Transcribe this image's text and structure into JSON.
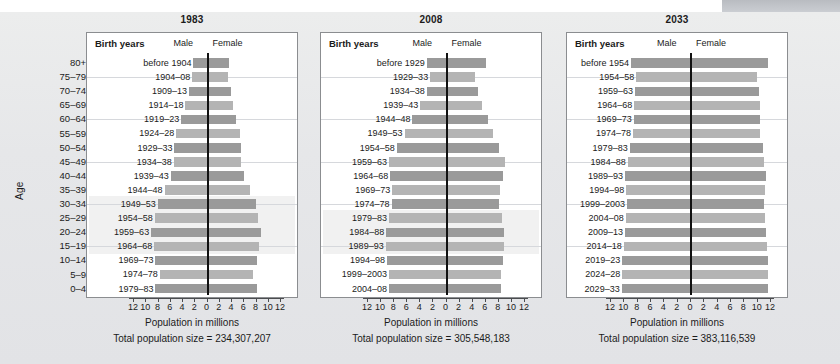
{
  "figure": {
    "corner_badge": "",
    "top_cut_text": ""
  },
  "axis": {
    "age_label": "Age",
    "age_groups": [
      "80+",
      "75–79",
      "70–74",
      "65–69",
      "60–64",
      "55–59",
      "50–54",
      "45–49",
      "40–44",
      "35–39",
      "30–34",
      "25–29",
      "20–24",
      "15–19",
      "10–14",
      "5–9",
      "0–4"
    ],
    "x_title": "Population in millions",
    "x_ticks": [
      12,
      10,
      8,
      6,
      4,
      2,
      0,
      2,
      4,
      6,
      8,
      10,
      12
    ],
    "x_max": 12,
    "headers": {
      "birth_years": "Birth years",
      "male": "Male",
      "female": "Female"
    }
  },
  "panels": [
    {
      "title": "1983",
      "total_label": "Total population size = 234,307,207",
      "birth_years": [
        "before 1904",
        "1904–08",
        "1909–13",
        "1914–18",
        "1919–23",
        "1924–28",
        "1929–33",
        "1934–38",
        "1939–43",
        "1944–48",
        "1949–53",
        "1954–58",
        "1959–63",
        "1964–68",
        "1969–73",
        "1974–78",
        "1979–83"
      ],
      "male": [
        2.3,
        2.5,
        3.0,
        3.6,
        4.3,
        5.1,
        5.4,
        5.5,
        6.0,
        7.0,
        8.1,
        8.6,
        9.2,
        8.7,
        8.5,
        7.8,
        8.5
      ],
      "female": [
        3.5,
        3.4,
        3.8,
        4.1,
        4.6,
        5.3,
        5.5,
        5.5,
        6.0,
        6.9,
        7.9,
        8.3,
        8.8,
        8.4,
        8.1,
        7.4,
        8.1
      ],
      "highlight_rows": [
        10,
        11,
        12,
        13
      ]
    },
    {
      "title": "2008",
      "total_label": "Total population size = 305,548,183",
      "birth_years": [
        "before 1929",
        "1929–33",
        "1934–38",
        "1939–43",
        "1944–48",
        "1949–53",
        "1954–58",
        "1959–63",
        "1964–68",
        "1969–73",
        "1974–78",
        "1979–83",
        "1984–88",
        "1989–93",
        "1994–98",
        "1999–2003",
        "2004–08"
      ],
      "male": [
        3.0,
        2.5,
        3.0,
        4.0,
        5.2,
        6.4,
        7.6,
        8.8,
        8.6,
        8.3,
        8.4,
        8.8,
        9.2,
        9.3,
        9.1,
        8.8,
        8.8
      ],
      "female": [
        6.0,
        4.4,
        4.8,
        5.4,
        6.3,
        7.1,
        8.0,
        8.9,
        8.6,
        8.2,
        8.1,
        8.5,
        8.8,
        8.8,
        8.6,
        8.4,
        8.4
      ],
      "highlight_rows": [
        11,
        12,
        13
      ]
    },
    {
      "title": "2033",
      "total_label": "Total population size = 383,116,539",
      "birth_years": [
        "before 1954",
        "1954–58",
        "1959–63",
        "1964–68",
        "1969–73",
        "1974–78",
        "1979–83",
        "1984–88",
        "1989–93",
        "1994–98",
        "1999–2003",
        "2004–08",
        "2009–13",
        "2014–18",
        "2019–23",
        "2024–28",
        "2029–33"
      ],
      "male": [
        9.0,
        8.2,
        8.4,
        8.5,
        8.6,
        8.7,
        9.2,
        9.5,
        9.9,
        9.7,
        9.6,
        9.8,
        9.9,
        10.1,
        10.3,
        10.3,
        10.4
      ],
      "female": [
        11.6,
        9.9,
        10.2,
        10.3,
        10.4,
        10.4,
        10.8,
        11.0,
        11.3,
        11.1,
        11.0,
        11.1,
        11.2,
        11.4,
        11.5,
        11.5,
        11.6
      ],
      "highlight_rows": []
    }
  ],
  "chart_data": {
    "type": "bar",
    "subtype": "population-pyramid (horizontal, mirrored, 3 small multiples)",
    "xlabel": "Population in millions",
    "ylabel": "Age",
    "xlim": [
      -12,
      12
    ],
    "xticks": [
      12,
      10,
      8,
      6,
      4,
      2,
      0,
      2,
      4,
      6,
      8,
      10,
      12
    ],
    "grid": true,
    "legend": [
      "Male",
      "Female"
    ],
    "legend_position": "top-center (labels flanking the centre axis)",
    "categories": [
      "80+",
      "75–79",
      "70–74",
      "65–69",
      "60–64",
      "55–59",
      "50–54",
      "45–49",
      "40–44",
      "35–39",
      "30–34",
      "25–29",
      "20–24",
      "15–19",
      "10–14",
      "5–9",
      "0–4"
    ],
    "panels": [
      {
        "title": "1983",
        "annotation": "Total population size = 234,307,207",
        "total_population": 234307207,
        "birth_years": [
          "before 1904",
          "1904–08",
          "1909–13",
          "1914–18",
          "1919–23",
          "1924–28",
          "1929–33",
          "1934–38",
          "1939–43",
          "1944–48",
          "1949–53",
          "1954–58",
          "1959–63",
          "1964–68",
          "1969–73",
          "1974–78",
          "1979–83"
        ],
        "series": [
          {
            "name": "Male",
            "values": [
              2.3,
              2.5,
              3.0,
              3.6,
              4.3,
              5.1,
              5.4,
              5.5,
              6.0,
              7.0,
              8.1,
              8.6,
              9.2,
              8.7,
              8.5,
              7.8,
              8.5
            ]
          },
          {
            "name": "Female",
            "values": [
              3.5,
              3.4,
              3.8,
              4.1,
              4.6,
              5.3,
              5.5,
              5.5,
              6.0,
              6.9,
              7.9,
              8.3,
              8.8,
              8.4,
              8.1,
              7.4,
              8.1
            ]
          }
        ]
      },
      {
        "title": "2008",
        "annotation": "Total population size = 305,548,183",
        "total_population": 305548183,
        "birth_years": [
          "before 1929",
          "1929–33",
          "1934–38",
          "1939–43",
          "1944–48",
          "1949–53",
          "1954–58",
          "1959–63",
          "1964–68",
          "1969–73",
          "1974–78",
          "1979–83",
          "1984–88",
          "1989–93",
          "1994–98",
          "1999–2003",
          "2004–08"
        ],
        "series": [
          {
            "name": "Male",
            "values": [
              3.0,
              2.5,
              3.0,
              4.0,
              5.2,
              6.4,
              7.6,
              8.8,
              8.6,
              8.3,
              8.4,
              8.8,
              9.2,
              9.3,
              9.1,
              8.8,
              8.8
            ]
          },
          {
            "name": "Female",
            "values": [
              6.0,
              4.4,
              4.8,
              5.4,
              6.3,
              7.1,
              8.0,
              8.9,
              8.6,
              8.2,
              8.1,
              8.5,
              8.8,
              8.8,
              8.6,
              8.4,
              8.4
            ]
          }
        ]
      },
      {
        "title": "2033",
        "annotation": "Total population size = 383,116,539",
        "total_population": 383116539,
        "birth_years": [
          "before 1954",
          "1954–58",
          "1959–63",
          "1964–68",
          "1969–73",
          "1974–78",
          "1979–83",
          "1984–88",
          "1989–93",
          "1994–98",
          "1999–2003",
          "2004–08",
          "2009–13",
          "2014–18",
          "2019–23",
          "2024–28",
          "2029–33"
        ],
        "series": [
          {
            "name": "Male",
            "values": [
              9.0,
              8.2,
              8.4,
              8.5,
              8.6,
              8.7,
              9.2,
              9.5,
              9.9,
              9.7,
              9.6,
              9.8,
              9.9,
              10.1,
              10.3,
              10.3,
              10.4
            ]
          },
          {
            "name": "Female",
            "values": [
              11.6,
              9.9,
              10.2,
              10.3,
              10.4,
              10.4,
              10.8,
              11.0,
              11.3,
              11.1,
              11.0,
              11.1,
              11.2,
              11.4,
              11.5,
              11.5,
              11.6
            ]
          }
        ]
      }
    ],
    "colors": {
      "bar": "#9a9a9a",
      "bar_light": "#b4b4b4",
      "axis": "#111111",
      "panel_bg": "#ffffff",
      "page_bg": "#e7e8ea"
    }
  }
}
